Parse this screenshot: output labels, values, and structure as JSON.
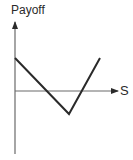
{
  "chart_data": {
    "type": "line",
    "title": "",
    "xlabel": "S",
    "ylabel": "Payoff",
    "grid": false,
    "legend": null,
    "axis_ranges": {
      "x": [
        0,
        1
      ],
      "y": [
        -1,
        1
      ]
    },
    "series": [
      {
        "name": "payoff",
        "points": [
          {
            "x": 0.0,
            "y": 0.5
          },
          {
            "x": 0.54,
            "y": -0.35
          },
          {
            "x": 0.83,
            "y": 0.5
          }
        ]
      }
    ],
    "annotations": [],
    "colors": {
      "axis": "#555555",
      "line": "#2a2a2a"
    },
    "pixel_geometry": {
      "origin": [
        15,
        91
      ],
      "y_axis_top": 22,
      "y_axis_bottom": 154,
      "x_axis_right": 118,
      "payoff_path": [
        [
          15,
          58
        ],
        [
          69,
          114
        ],
        [
          100,
          58
        ]
      ]
    }
  }
}
